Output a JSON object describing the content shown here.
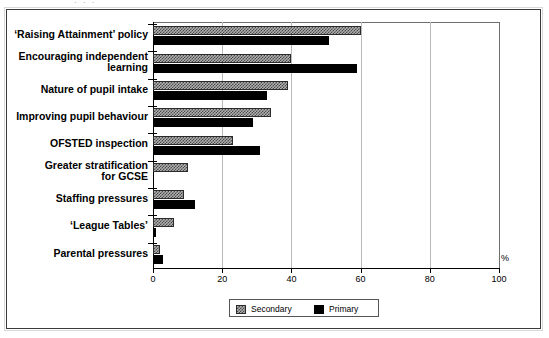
{
  "figure": {
    "top_fragment": "· ·  ·",
    "axis_unit_label": "%"
  },
  "legend": {
    "position": "bottom-center",
    "entries": [
      {
        "label": "Secondary",
        "swatch": "hatched-grey",
        "color": "#b0b0b0"
      },
      {
        "label": "Primary",
        "swatch": "solid-black",
        "color": "#000000"
      }
    ]
  },
  "chart_data": {
    "type": "bar",
    "orientation": "horizontal",
    "title": "",
    "xlabel": "%",
    "ylabel": "",
    "xlim": [
      0,
      100
    ],
    "xticks": [
      0,
      20,
      40,
      60,
      80,
      100
    ],
    "xticklabels": [
      "0",
      "20",
      "40",
      "60",
      "80",
      "100"
    ],
    "grid": true,
    "categories": [
      "‘Raising Attainment’ policy",
      "Encouraging independent learning",
      "Nature of pupil intake",
      "Improving pupil behaviour",
      "OFSTED inspection",
      "Greater stratification for GCSE",
      "Staffing pressures",
      "‘League Tables’",
      "Parental  pressures"
    ],
    "category_lines": [
      [
        "‘Raising Attainment’ policy"
      ],
      [
        "Encouraging independent",
        "learning"
      ],
      [
        "Nature of pupil intake"
      ],
      [
        "Improving pupil behaviour"
      ],
      [
        "OFSTED inspection"
      ],
      [
        "Greater stratification",
        "for GCSE"
      ],
      [
        "Staffing pressures"
      ],
      [
        "‘League Tables’"
      ],
      [
        "Parental  pressures"
      ]
    ],
    "series": [
      {
        "name": "Secondary",
        "color": "#b0b0b0",
        "values": [
          60,
          40,
          39,
          34,
          23,
          10,
          9,
          6,
          2
        ]
      },
      {
        "name": "Primary",
        "color": "#000000",
        "values": [
          51,
          59,
          33,
          29,
          31,
          0,
          12,
          1,
          3
        ]
      }
    ]
  }
}
